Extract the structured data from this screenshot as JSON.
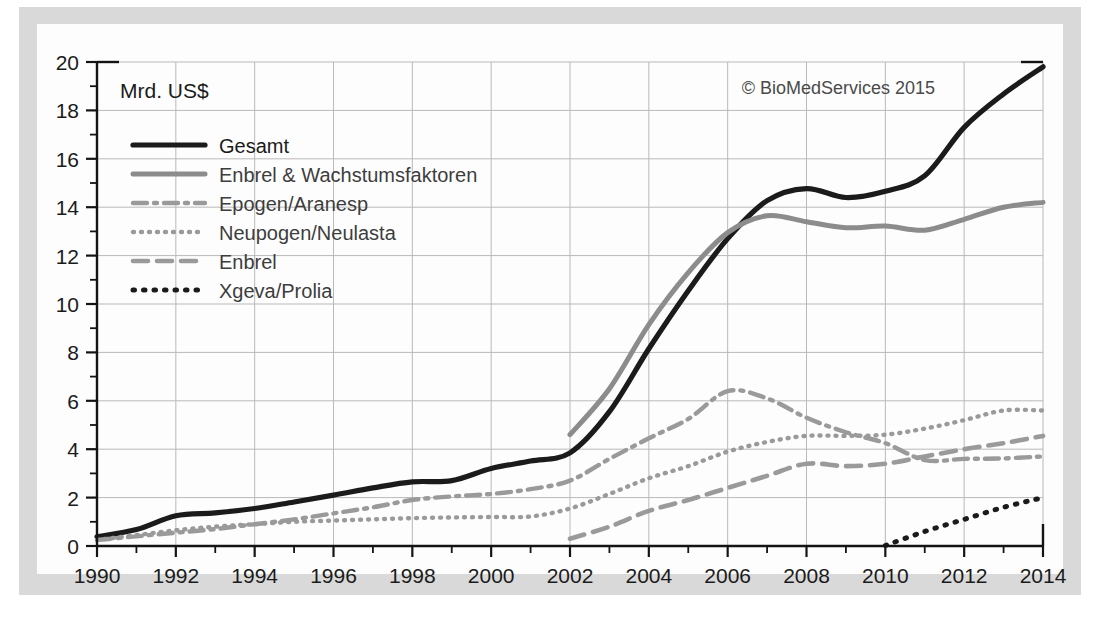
{
  "figure": {
    "axis_unit_label": "Mrd. US$",
    "credit": "© BioMedServices 2015"
  },
  "legend": {
    "items": [
      {
        "label": "Gesamt",
        "style": "solid-thick-black",
        "color": "#1b1b1b"
      },
      {
        "label": "Enbrel & Wachstumsfaktoren",
        "style": "solid-thick-grey",
        "color": "#8c8c8c"
      },
      {
        "label": "Epogen/Aranesp",
        "style": "dash-dot-grey",
        "color": "#9a9a9a"
      },
      {
        "label": "Neupogen/Neulasta",
        "style": "dotted-grey",
        "color": "#9a9a9a"
      },
      {
        "label": "Enbrel",
        "style": "dashed-grey",
        "color": "#9a9a9a"
      },
      {
        "label": "Xgeva/Prolia",
        "style": "dotted-black",
        "color": "#1b1b1b"
      }
    ]
  },
  "chart_data": {
    "type": "line",
    "title": "",
    "subtitle": "",
    "xlabel": "",
    "ylabel": "Mrd. US$",
    "xlim": [
      1990,
      2014
    ],
    "ylim": [
      0,
      20
    ],
    "ytick_step": 2,
    "yminor_step": 1,
    "xtick_step": 2,
    "xminor_step": 1,
    "grid": true,
    "legend_position": "upper-left-inside",
    "ytick_labels": [
      0,
      2,
      4,
      6,
      8,
      10,
      12,
      14,
      16,
      18,
      20
    ],
    "xtick_labels": [
      1990,
      1992,
      1994,
      1996,
      1998,
      2000,
      2002,
      2004,
      2006,
      2008,
      2010,
      2012,
      2014
    ],
    "x": [
      1990,
      1991,
      1992,
      1993,
      1994,
      1995,
      1996,
      1997,
      1998,
      1999,
      2000,
      2001,
      2002,
      2003,
      2004,
      2005,
      2006,
      2007,
      2008,
      2009,
      2010,
      2011,
      2012,
      2013,
      2014
    ],
    "series": [
      {
        "name": "Gesamt",
        "color": "#1b1b1b",
        "style": "solid-thick-black",
        "values": [
          0.38,
          0.68,
          1.25,
          1.37,
          1.55,
          1.82,
          2.1,
          2.4,
          2.65,
          2.7,
          3.2,
          3.51,
          3.85,
          5.55,
          8.15,
          10.55,
          12.7,
          14.27,
          14.77,
          14.4,
          14.66,
          15.3,
          17.3,
          18.68,
          19.8
        ]
      },
      {
        "name": "Enbrel & Wachstumsfaktoren",
        "color": "#8c8c8c",
        "style": "solid-thick-grey",
        "start_year": 2002,
        "values": [
          null,
          null,
          null,
          null,
          null,
          null,
          null,
          null,
          null,
          null,
          null,
          null,
          4.6,
          6.5,
          9.15,
          11.3,
          12.95,
          13.65,
          13.4,
          13.15,
          13.22,
          13.05,
          13.5,
          14.0,
          14.2
        ]
      },
      {
        "name": "Epogen/Aranesp",
        "color": "#9a9a9a",
        "style": "dash-dot-grey",
        "values": [
          0.25,
          0.4,
          0.55,
          0.7,
          0.9,
          1.1,
          1.35,
          1.6,
          1.9,
          2.05,
          2.15,
          2.35,
          2.7,
          3.6,
          4.45,
          5.25,
          6.4,
          6.1,
          5.3,
          4.7,
          4.25,
          3.55,
          3.6,
          3.62,
          3.7
        ]
      },
      {
        "name": "Neupogen/Neulasta",
        "color": "#9a9a9a",
        "style": "dotted-grey",
        "values": [
          0.25,
          0.45,
          0.65,
          0.8,
          0.9,
          1.0,
          1.05,
          1.1,
          1.15,
          1.18,
          1.2,
          1.22,
          1.55,
          2.15,
          2.8,
          3.3,
          3.9,
          4.3,
          4.55,
          4.55,
          4.6,
          4.85,
          5.2,
          5.6,
          5.6
        ]
      },
      {
        "name": "Enbrel",
        "color": "#9a9a9a",
        "style": "dashed-grey",
        "start_year": 2002,
        "values": [
          null,
          null,
          null,
          null,
          null,
          null,
          null,
          null,
          null,
          null,
          null,
          null,
          0.3,
          0.8,
          1.45,
          1.9,
          2.4,
          2.9,
          3.4,
          3.3,
          3.4,
          3.7,
          4.0,
          4.25,
          4.55
        ]
      },
      {
        "name": "Xgeva/Prolia",
        "color": "#1b1b1b",
        "style": "dotted-black",
        "start_year": 2010,
        "values": [
          null,
          null,
          null,
          null,
          null,
          null,
          null,
          null,
          null,
          null,
          null,
          null,
          null,
          null,
          null,
          null,
          null,
          null,
          null,
          null,
          0.02,
          0.6,
          1.1,
          1.6,
          2.0
        ]
      }
    ]
  }
}
